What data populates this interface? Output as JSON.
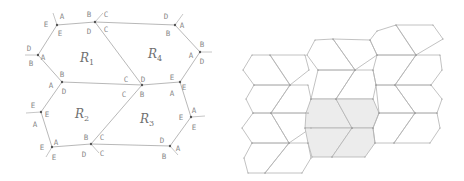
{
  "left_diagram": {
    "regions": [
      {
        "id": "R1",
        "label": "R",
        "sub": "1",
        "x": 80,
        "y": 62
      },
      {
        "id": "R2",
        "label": "R",
        "sub": "2",
        "x": 75,
        "y": 118
      },
      {
        "id": "R3",
        "label": "R",
        "sub": "3",
        "x": 140,
        "y": 123
      },
      {
        "id": "R4",
        "label": "R",
        "sub": "4",
        "x": 148,
        "y": 58
      }
    ],
    "vertex_labels": [
      {
        "t": "A",
        "x": 62,
        "y": 19
      },
      {
        "t": "E",
        "x": 46,
        "y": 27
      },
      {
        "t": "E",
        "x": 60,
        "y": 36
      },
      {
        "t": "B",
        "x": 89,
        "y": 17
      },
      {
        "t": "C",
        "x": 106,
        "y": 17
      },
      {
        "t": "D",
        "x": 89,
        "y": 34
      },
      {
        "t": "C",
        "x": 106,
        "y": 32
      },
      {
        "t": "D",
        "x": 166,
        "y": 19
      },
      {
        "t": "A",
        "x": 182,
        "y": 28
      },
      {
        "t": "B",
        "x": 168,
        "y": 36
      },
      {
        "t": "B",
        "x": 202,
        "y": 47
      },
      {
        "t": "A",
        "x": 191,
        "y": 58
      },
      {
        "t": "D",
        "x": 202,
        "y": 64
      },
      {
        "t": "D",
        "x": 29,
        "y": 51
      },
      {
        "t": "A",
        "x": 43,
        "y": 60
      },
      {
        "t": "B",
        "x": 31,
        "y": 66
      },
      {
        "t": "B",
        "x": 62,
        "y": 77
      },
      {
        "t": "A",
        "x": 51,
        "y": 88
      },
      {
        "t": "D",
        "x": 64,
        "y": 94
      },
      {
        "t": "C",
        "x": 126,
        "y": 82
      },
      {
        "t": "D",
        "x": 143,
        "y": 82
      },
      {
        "t": "C",
        "x": 124,
        "y": 97
      },
      {
        "t": "B",
        "x": 142,
        "y": 97
      },
      {
        "t": "E",
        "x": 172,
        "y": 80
      },
      {
        "t": "A",
        "x": 172,
        "y": 96
      },
      {
        "t": "E",
        "x": 184,
        "y": 90
      },
      {
        "t": "E",
        "x": 33,
        "y": 108
      },
      {
        "t": "E",
        "x": 47,
        "y": 117
      },
      {
        "t": "A",
        "x": 35,
        "y": 127
      },
      {
        "t": "A",
        "x": 194,
        "y": 113
      },
      {
        "t": "E",
        "x": 181,
        "y": 120
      },
      {
        "t": "E",
        "x": 194,
        "y": 130
      },
      {
        "t": "A",
        "x": 56,
        "y": 145
      },
      {
        "t": "E",
        "x": 42,
        "y": 150
      },
      {
        "t": "E",
        "x": 54,
        "y": 160
      },
      {
        "t": "B",
        "x": 86,
        "y": 140
      },
      {
        "t": "C",
        "x": 102,
        "y": 140
      },
      {
        "t": "D",
        "x": 84,
        "y": 157
      },
      {
        "t": "C",
        "x": 102,
        "y": 156
      },
      {
        "t": "D",
        "x": 162,
        "y": 143
      },
      {
        "t": "A",
        "x": 178,
        "y": 151
      },
      {
        "t": "B",
        "x": 164,
        "y": 159
      }
    ],
    "vertices": [
      [
        57,
        25
      ],
      [
        95,
        22
      ],
      [
        175,
        25
      ],
      [
        200,
        52
      ],
      [
        180,
        82
      ],
      [
        191,
        117
      ],
      [
        170,
        146
      ],
      [
        91,
        144
      ],
      [
        52,
        147
      ],
      [
        41,
        112
      ],
      [
        62,
        82
      ],
      [
        38,
        55
      ],
      [
        142,
        85
      ]
    ],
    "edges": [
      [
        0,
        1
      ],
      [
        1,
        2
      ],
      [
        2,
        3
      ],
      [
        3,
        4
      ],
      [
        4,
        5
      ],
      [
        5,
        6
      ],
      [
        6,
        7
      ],
      [
        7,
        8
      ],
      [
        8,
        9
      ],
      [
        9,
        10
      ],
      [
        10,
        11
      ],
      [
        11,
        0
      ],
      [
        1,
        12
      ],
      [
        12,
        7
      ],
      [
        10,
        12
      ],
      [
        12,
        4
      ]
    ],
    "stubs": [
      [
        [
          57,
          25
        ],
        [
          53,
          13
        ]
      ],
      [
        [
          95,
          22
        ],
        [
          103,
          13
        ]
      ],
      [
        [
          175,
          25
        ],
        [
          183,
          14
        ]
      ],
      [
        [
          200,
          52
        ],
        [
          212,
          52
        ]
      ],
      [
        [
          38,
          55
        ],
        [
          25,
          55
        ]
      ],
      [
        [
          41,
          112
        ],
        [
          26,
          113
        ]
      ],
      [
        [
          191,
          117
        ],
        [
          205,
          116
        ]
      ],
      [
        [
          52,
          147
        ],
        [
          46,
          157
        ]
      ],
      [
        [
          91,
          144
        ],
        [
          99,
          153
        ]
      ],
      [
        [
          170,
          146
        ],
        [
          178,
          155
        ]
      ]
    ]
  },
  "right_tiling": {
    "shaded_color": "#ececec",
    "edge_color": "#b3b3b3",
    "tiles": [
      {
        "pts": [
          [
            252,
            55
          ],
          [
            270,
            55
          ],
          [
            290,
            85
          ],
          [
            254,
            85
          ],
          [
            243,
            70
          ]
        ],
        "shaded": false
      },
      {
        "pts": [
          [
            270,
            55
          ],
          [
            305,
            55
          ],
          [
            309,
            70
          ],
          [
            290,
            85
          ]
        ],
        "shaded": false
      },
      {
        "pts": [
          [
            254,
            85
          ],
          [
            290,
            85
          ],
          [
            271,
            113
          ],
          [
            253,
            113
          ],
          [
            246,
            99
          ]
        ],
        "shaded": false
      },
      {
        "pts": [
          [
            290,
            85
          ],
          [
            308,
            85
          ],
          [
            311,
            99
          ],
          [
            308,
            113
          ],
          [
            271,
            113
          ]
        ],
        "shaded": false
      },
      {
        "pts": [
          [
            253,
            113
          ],
          [
            271,
            113
          ],
          [
            289,
            143
          ],
          [
            252,
            143
          ],
          [
            242,
            128
          ]
        ],
        "shaded": false
      },
      {
        "pts": [
          [
            271,
            113
          ],
          [
            308,
            113
          ],
          [
            311,
            128
          ],
          [
            289,
            143
          ]
        ],
        "shaded": false
      },
      {
        "pts": [
          [
            252,
            143
          ],
          [
            289,
            143
          ],
          [
            265,
            173
          ],
          [
            248,
            173
          ],
          [
            244,
            158
          ]
        ],
        "shaded": false
      },
      {
        "pts": [
          [
            289,
            143
          ],
          [
            308,
            143
          ],
          [
            311,
            158
          ],
          [
            302,
            173
          ],
          [
            265,
            173
          ]
        ],
        "shaded": false
      },
      {
        "pts": [
          [
            315,
            40
          ],
          [
            333,
            39
          ],
          [
            355,
            70
          ],
          [
            318,
            70
          ],
          [
            307,
            55
          ]
        ],
        "shaded": false
      },
      {
        "pts": [
          [
            333,
            39
          ],
          [
            370,
            40
          ],
          [
            377,
            55
          ],
          [
            355,
            70
          ]
        ],
        "shaded": false
      },
      {
        "pts": [
          [
            318,
            70
          ],
          [
            355,
            70
          ],
          [
            336,
            99
          ],
          [
            311,
            99
          ]
        ],
        "shaded": false
      },
      {
        "pts": [
          [
            355,
            70
          ],
          [
            373,
            70
          ],
          [
            376,
            85
          ],
          [
            373,
            99
          ],
          [
            336,
            99
          ]
        ],
        "shaded": false
      },
      {
        "pts": [
          [
            311,
            99
          ],
          [
            336,
            99
          ],
          [
            352,
            128
          ],
          [
            305,
            128
          ],
          [
            306,
            113
          ]
        ],
        "shaded": true
      },
      {
        "pts": [
          [
            336,
            99
          ],
          [
            373,
            99
          ],
          [
            379,
            113
          ],
          [
            373,
            128
          ],
          [
            352,
            128
          ]
        ],
        "shaded": true
      },
      {
        "pts": [
          [
            305,
            128
          ],
          [
            352,
            128
          ],
          [
            332,
            157
          ],
          [
            312,
            157
          ],
          [
            308,
            143
          ]
        ],
        "shaded": true
      },
      {
        "pts": [
          [
            352,
            128
          ],
          [
            373,
            128
          ],
          [
            375,
            143
          ],
          [
            365,
            157
          ],
          [
            332,
            157
          ]
        ],
        "shaded": true
      },
      {
        "pts": [
          [
            377,
            31
          ],
          [
            396,
            25
          ],
          [
            416,
            55
          ],
          [
            377,
            55
          ],
          [
            370,
            40
          ]
        ],
        "shaded": false
      },
      {
        "pts": [
          [
            396,
            25
          ],
          [
            433,
            25
          ],
          [
            443,
            39
          ],
          [
            416,
            55
          ]
        ],
        "shaded": false
      },
      {
        "pts": [
          [
            377,
            55
          ],
          [
            416,
            55
          ],
          [
            395,
            85
          ],
          [
            376,
            85
          ],
          [
            373,
            70
          ]
        ],
        "shaded": false
      },
      {
        "pts": [
          [
            416,
            55
          ],
          [
            440,
            55
          ],
          [
            442,
            70
          ],
          [
            431,
            85
          ],
          [
            395,
            85
          ]
        ],
        "shaded": false
      },
      {
        "pts": [
          [
            376,
            85
          ],
          [
            395,
            85
          ],
          [
            415,
            113
          ],
          [
            379,
            113
          ]
        ],
        "shaded": false
      },
      {
        "pts": [
          [
            395,
            85
          ],
          [
            431,
            85
          ],
          [
            442,
            99
          ],
          [
            437,
            113
          ],
          [
            415,
            113
          ]
        ],
        "shaded": false
      },
      {
        "pts": [
          [
            379,
            113
          ],
          [
            415,
            113
          ],
          [
            394,
            143
          ],
          [
            375,
            143
          ],
          [
            373,
            128
          ]
        ],
        "shaded": false
      },
      {
        "pts": [
          [
            415,
            113
          ],
          [
            437,
            113
          ],
          [
            440,
            128
          ],
          [
            430,
            143
          ],
          [
            394,
            143
          ]
        ],
        "shaded": false
      }
    ]
  }
}
